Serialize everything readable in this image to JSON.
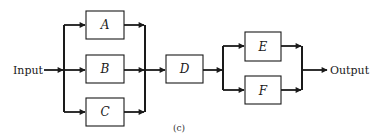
{
  "diagram": {
    "type": "reliability-block-diagram",
    "input_label": "Input",
    "output_label": "Output",
    "caption": "(c)",
    "line_color": "#1a1a1a",
    "blocks": [
      {
        "id": "A",
        "label": "A",
        "group": "parallel-1"
      },
      {
        "id": "B",
        "label": "B",
        "group": "parallel-1"
      },
      {
        "id": "C",
        "label": "C",
        "group": "parallel-1"
      },
      {
        "id": "D",
        "label": "D",
        "group": "series"
      },
      {
        "id": "E",
        "label": "E",
        "group": "parallel-2"
      },
      {
        "id": "F",
        "label": "F",
        "group": "parallel-2"
      }
    ],
    "structure": [
      {
        "stage": 1,
        "kind": "parallel",
        "members": [
          "A",
          "B",
          "C"
        ]
      },
      {
        "stage": 2,
        "kind": "series",
        "members": [
          "D"
        ]
      },
      {
        "stage": 3,
        "kind": "parallel",
        "members": [
          "E",
          "F"
        ]
      }
    ]
  }
}
